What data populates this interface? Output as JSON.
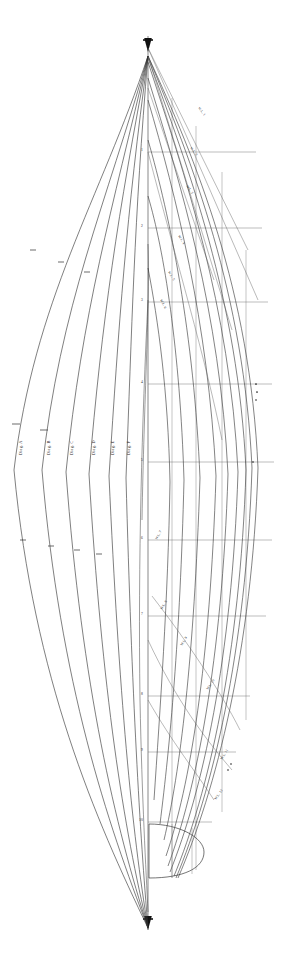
{
  "document": {
    "kind": "naval-architecture-lines-plan",
    "title": "Hull Lines Plan",
    "background_color": "#ffffff",
    "ink_color": "#262626",
    "faint_ink_color": "#7a7a7a"
  },
  "canvas": {
    "width": 290,
    "height": 966
  },
  "centerline": {
    "label": "centerline",
    "x": 148,
    "top_y": 36,
    "bottom_y": 930,
    "bow_arrow": "▼",
    "stern_arrow": "▼"
  },
  "diagonals": {
    "group_label": "diagonals",
    "items": [
      {
        "label": "Diag. A",
        "label_x": 22,
        "label_y": 455,
        "apex_x": 148,
        "bulge_x": 14,
        "top_y": 58,
        "bot_y": 928
      },
      {
        "label": "Diag. B",
        "label_x": 50,
        "label_y": 455,
        "apex_x": 148,
        "bulge_x": 42,
        "top_y": 58,
        "bot_y": 928
      },
      {
        "label": "Diag. C",
        "label_x": 73,
        "label_y": 455,
        "apex_x": 148,
        "bulge_x": 66,
        "top_y": 58,
        "bot_y": 928
      },
      {
        "label": "Diag. D",
        "label_x": 95,
        "label_y": 455,
        "apex_x": 148,
        "bulge_x": 89,
        "top_y": 58,
        "bot_y": 928
      },
      {
        "label": "Diag. E",
        "label_x": 114,
        "label_y": 455,
        "apex_x": 148,
        "bulge_x": 109,
        "top_y": 58,
        "bot_y": 928
      },
      {
        "label": "Diag. F",
        "label_x": 130,
        "label_y": 455,
        "apex_x": 148,
        "bulge_x": 126,
        "top_y": 58,
        "bot_y": 928
      }
    ]
  },
  "waterlines": {
    "group_label": "waterlines",
    "labels": [
      {
        "text": "W.L. 1",
        "x": 198,
        "y": 108,
        "rot": 52
      },
      {
        "text": "W.L. 2",
        "x": 190,
        "y": 148,
        "rot": 52
      },
      {
        "text": "W.L. 3",
        "x": 186,
        "y": 186,
        "rot": 55
      },
      {
        "text": "W.L. 4",
        "x": 178,
        "y": 236,
        "rot": 58
      },
      {
        "text": "W.L. 5",
        "x": 168,
        "y": 272,
        "rot": 60
      },
      {
        "text": "W.L. 6",
        "x": 160,
        "y": 300,
        "rot": 62
      },
      {
        "text": "W.L. 7",
        "x": 157,
        "y": 540,
        "rot": -62
      },
      {
        "text": "W.L. 8",
        "x": 162,
        "y": 610,
        "rot": -60
      },
      {
        "text": "W.L. 9",
        "x": 182,
        "y": 646,
        "rot": -58
      },
      {
        "text": "W.L. 10",
        "x": 208,
        "y": 690,
        "rot": -56
      },
      {
        "text": "W.L. 11",
        "x": 222,
        "y": 760,
        "rot": -58
      },
      {
        "text": "W.L. 12",
        "x": 216,
        "y": 800,
        "rot": -55
      }
    ]
  },
  "stations": {
    "group_label": "station-lines",
    "rows": [
      {
        "number": "1",
        "y": 152
      },
      {
        "number": "2",
        "y": 228
      },
      {
        "number": "3",
        "y": 302
      },
      {
        "number": "4",
        "y": 384
      },
      {
        "number": "5",
        "y": 462
      },
      {
        "number": "6",
        "y": 540
      },
      {
        "number": "7",
        "y": 616
      },
      {
        "number": "8",
        "y": 696
      },
      {
        "number": "9",
        "y": 752
      },
      {
        "number": "10",
        "y": 820
      }
    ]
  },
  "buttocks": {
    "group_label": "buttock-lines",
    "x_positions": [
      172,
      196,
      222,
      246
    ]
  },
  "stern": {
    "label": "transom-outline",
    "top_y": 822,
    "bottom_y": 878,
    "left_x": 149,
    "right_x": 205
  },
  "legend": {
    "diag_prefix": "Diag.",
    "wl_prefix": "W.L."
  }
}
